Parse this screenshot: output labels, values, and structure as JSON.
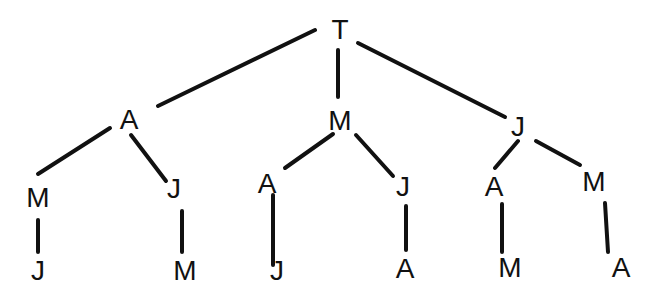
{
  "diagram": {
    "type": "tree",
    "colors": {
      "ink": "#111111",
      "background": "#ffffff"
    },
    "nodes": [
      {
        "id": "n0",
        "label": "T",
        "x": 340,
        "y": 30
      },
      {
        "id": "n1",
        "label": "A",
        "x": 129,
        "y": 120
      },
      {
        "id": "n2",
        "label": "M",
        "x": 340,
        "y": 121
      },
      {
        "id": "n3",
        "label": "J",
        "x": 518,
        "y": 127
      },
      {
        "id": "n4",
        "label": "M",
        "x": 38,
        "y": 198
      },
      {
        "id": "n5",
        "label": "J",
        "x": 174,
        "y": 189
      },
      {
        "id": "n6",
        "label": "A",
        "x": 267,
        "y": 184
      },
      {
        "id": "n7",
        "label": "J",
        "x": 403,
        "y": 187
      },
      {
        "id": "n8",
        "label": "A",
        "x": 494,
        "y": 187
      },
      {
        "id": "n9",
        "label": "M",
        "x": 594,
        "y": 182
      },
      {
        "id": "n10",
        "label": "J",
        "x": 38,
        "y": 271
      },
      {
        "id": "n11",
        "label": "M",
        "x": 185,
        "y": 271
      },
      {
        "id": "n12",
        "label": "J",
        "x": 277,
        "y": 271
      },
      {
        "id": "n13",
        "label": "A",
        "x": 405,
        "y": 269
      },
      {
        "id": "n14",
        "label": "M",
        "x": 510,
        "y": 268
      },
      {
        "id": "n15",
        "label": "A",
        "x": 621,
        "y": 268
      }
    ],
    "edges": [
      {
        "from": "n0",
        "to": "n1",
        "x1": 315,
        "y1": 30,
        "x2": 158,
        "y2": 106
      },
      {
        "from": "n0",
        "to": "n2",
        "x1": 338,
        "y1": 50,
        "x2": 338,
        "y2": 97
      },
      {
        "from": "n0",
        "to": "n3",
        "x1": 358,
        "y1": 43,
        "x2": 505,
        "y2": 117
      },
      {
        "from": "n1",
        "to": "n4",
        "x1": 110,
        "y1": 128,
        "x2": 38,
        "y2": 174
      },
      {
        "from": "n1",
        "to": "n5",
        "x1": 131,
        "y1": 135,
        "x2": 166,
        "y2": 181
      },
      {
        "from": "n2",
        "to": "n6",
        "x1": 333,
        "y1": 134,
        "x2": 285,
        "y2": 168
      },
      {
        "from": "n2",
        "to": "n7",
        "x1": 356,
        "y1": 135,
        "x2": 393,
        "y2": 176
      },
      {
        "from": "n3",
        "to": "n8",
        "x1": 518,
        "y1": 141,
        "x2": 495,
        "y2": 168
      },
      {
        "from": "n3",
        "to": "n9",
        "x1": 536,
        "y1": 141,
        "x2": 580,
        "y2": 165
      },
      {
        "from": "n4",
        "to": "n10",
        "x1": 38,
        "y1": 220,
        "x2": 38,
        "y2": 252
      },
      {
        "from": "n5",
        "to": "n11",
        "x1": 182,
        "y1": 211,
        "x2": 182,
        "y2": 252
      },
      {
        "from": "n6",
        "to": "n12",
        "x1": 273,
        "y1": 195,
        "x2": 273,
        "y2": 265
      },
      {
        "from": "n7",
        "to": "n13",
        "x1": 406,
        "y1": 206,
        "x2": 406,
        "y2": 250
      },
      {
        "from": "n8",
        "to": "n14",
        "x1": 502,
        "y1": 204,
        "x2": 502,
        "y2": 252
      },
      {
        "from": "n9",
        "to": "n15",
        "x1": 605,
        "y1": 203,
        "x2": 608,
        "y2": 252
      }
    ]
  }
}
